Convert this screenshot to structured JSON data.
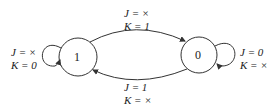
{
  "diagram": {
    "type": "state-diagram",
    "states": [
      {
        "id": "s1",
        "label": "1"
      },
      {
        "id": "s0",
        "label": "0"
      }
    ],
    "transitions": [
      {
        "from": "1",
        "to": "0",
        "line1": "J = ×",
        "line2": "K = 1"
      },
      {
        "from": "0",
        "to": "1",
        "line1": "J = 1",
        "line2": "K = ×"
      },
      {
        "from": "1",
        "to": "1",
        "line1": "J = ×",
        "line2": "K = 0"
      },
      {
        "from": "0",
        "to": "0",
        "line1": "J = 0",
        "line2": "K = ×"
      }
    ]
  }
}
